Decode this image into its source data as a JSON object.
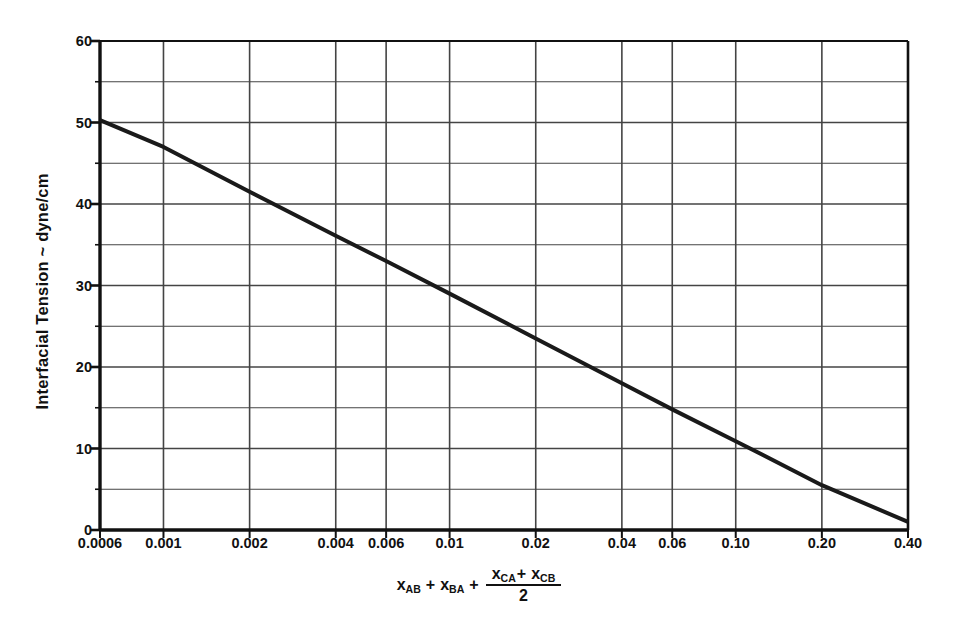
{
  "chart_data": {
    "type": "line",
    "title": "",
    "xlabel": "x_AB + x_BA + (x_CA + x_CB)/2",
    "ylabel": "Interfacial Tension ~ dyne/cm",
    "xscale": "log",
    "yscale": "linear",
    "xlim": [
      0.0006,
      0.4
    ],
    "ylim": [
      0,
      60
    ],
    "grid": true,
    "legend": null,
    "x_tick_labels": [
      "0.0006",
      "0.001",
      "0.002",
      "0.004",
      "0.006",
      "0.01",
      "0.02",
      "0.04",
      "0.06",
      "0.10",
      "0.20",
      "0.40"
    ],
    "x_tick_values": [
      0.0006,
      0.001,
      0.002,
      0.004,
      0.006,
      0.01,
      0.02,
      0.04,
      0.06,
      0.1,
      0.2,
      0.4
    ],
    "y_tick_labels": [
      "0",
      "10",
      "20",
      "30",
      "40",
      "50",
      "60"
    ],
    "y_tick_values": [
      0,
      10,
      20,
      30,
      40,
      50,
      60
    ],
    "y_minor_tick_values": [
      5,
      15,
      25,
      35,
      45,
      55
    ],
    "series": [
      {
        "name": "interfacial tension correlation",
        "color": "#1a1a1a",
        "linewidth": 4,
        "x": [
          0.0006,
          0.001,
          0.002,
          0.004,
          0.006,
          0.01,
          0.02,
          0.04,
          0.06,
          0.1,
          0.2,
          0.4
        ],
        "y": [
          50.3,
          47.0,
          41.5,
          36.1,
          33.0,
          29.0,
          23.5,
          18.0,
          14.8,
          10.9,
          5.5,
          1.0
        ]
      }
    ]
  },
  "axes": {
    "ylabel_text": "Interfacial Tension ~ dyne/cm",
    "formula": {
      "term1_base": "x",
      "term1_sub": "AB",
      "plus1": "+",
      "term2_base": "x",
      "term2_sub": "BA",
      "plus2": "+",
      "num_term1_base": "x",
      "num_term1_sub": "CA",
      "num_plus": "+",
      "num_term2_base": "x",
      "num_term2_sub": "CB",
      "denominator": "2"
    }
  },
  "style": {
    "axis_color": "#111111",
    "grid_color": "#444444",
    "line_color": "#1a1a1a",
    "background": "#ffffff"
  }
}
